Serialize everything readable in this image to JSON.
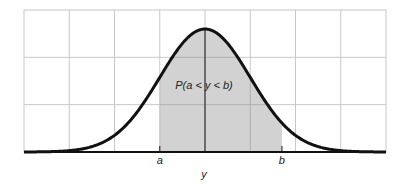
{
  "figure": {
    "area_label": "P(a < y < b)",
    "x_axis_label": "y",
    "lower_bound_label": "a",
    "upper_bound_label": "b"
  },
  "colors": {
    "grid": "#c8c8c8",
    "curve": "#111111",
    "shade": "#d2d2d2",
    "axis": "#111111"
  },
  "chart_data": {
    "type": "area",
    "distribution": "normal",
    "mean": 0,
    "sd": 1,
    "xlim": [
      -4,
      4
    ],
    "ylim": [
      0,
      0.45
    ],
    "grid": true,
    "grid_columns": 8,
    "grid_rows": 3,
    "shaded_interval": [
      -1,
      1.7
    ],
    "annotations": [
      "P(a < y < b)"
    ],
    "tick_labels": [
      {
        "x": -1,
        "label": "a"
      },
      {
        "x": 1.7,
        "label": "b"
      }
    ],
    "xlabel": "y",
    "ylabel": ""
  }
}
